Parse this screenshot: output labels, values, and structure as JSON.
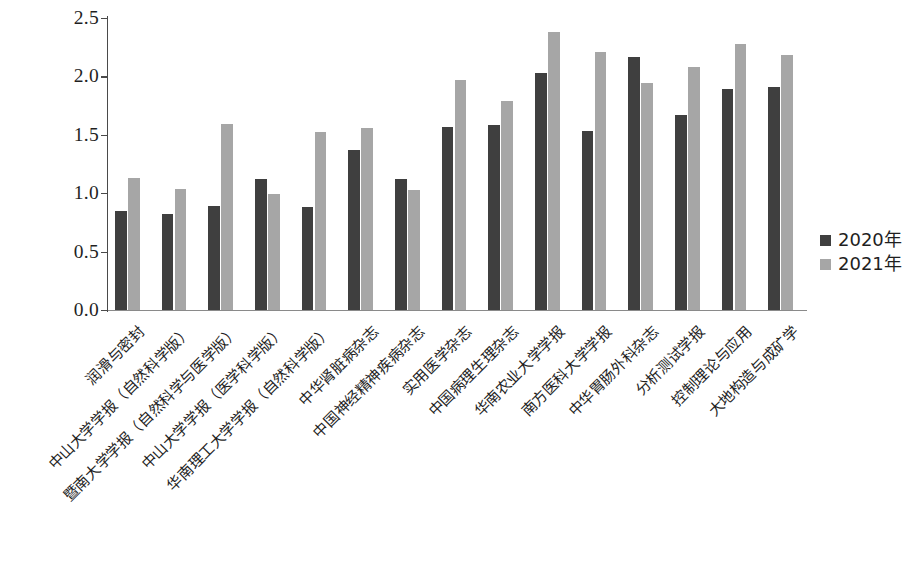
{
  "chart_data": {
    "type": "bar",
    "title": "",
    "xlabel": "",
    "ylabel": "",
    "ylim": [
      0.0,
      2.5
    ],
    "ytick_labels": [
      "0.0",
      "0.5",
      "1.0",
      "1.5",
      "2.0",
      "2.5"
    ],
    "ytick_values": [
      0.0,
      0.5,
      1.0,
      1.5,
      2.0,
      2.5
    ],
    "grid": false,
    "legend_position": "right",
    "categories": [
      "润滑与密封",
      "中山大学学报（自然科学版）",
      "暨南大学学报（自然科学与医学版）",
      "中山大学学报（医学科学版）",
      "华南理工大学学报（自然科学版）",
      "中华肾脏病杂志",
      "中国神经精神疾病杂志",
      "实用医学杂志",
      "中国病理生理杂志",
      "华南农业大学学报",
      "南方医科大学学报",
      "中华胃肠外科杂志",
      "分析测试学报",
      "控制理论与应用",
      "大地构造与成矿学"
    ],
    "series": [
      {
        "name": "2020年",
        "color": "#3f3f3f",
        "values": [
          0.85,
          0.82,
          0.89,
          1.12,
          0.88,
          1.37,
          1.12,
          1.57,
          1.58,
          2.03,
          1.53,
          2.17,
          1.67,
          1.89,
          1.91
        ]
      },
      {
        "name": "2021年",
        "color": "#a6a6a6",
        "values": [
          1.13,
          1.04,
          1.59,
          0.99,
          1.52,
          1.56,
          1.03,
          1.97,
          1.79,
          2.38,
          2.21,
          1.94,
          2.08,
          2.28,
          2.18
        ]
      }
    ]
  },
  "legend": {
    "items": [
      {
        "label": "2020年",
        "color": "#3f3f3f"
      },
      {
        "label": "2021年",
        "color": "#a6a6a6"
      }
    ]
  }
}
